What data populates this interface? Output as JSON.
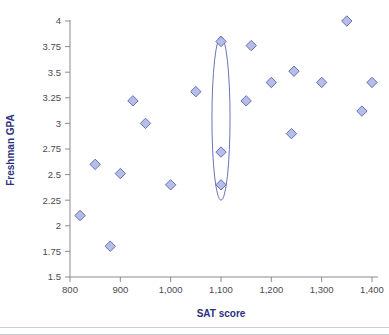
{
  "chart_data": {
    "type": "scatter",
    "title": "",
    "xlabel": "SAT score",
    "ylabel": "Freshman GPA",
    "xlim": [
      800,
      1400
    ],
    "ylim": [
      1.5,
      4
    ],
    "grid": false,
    "legend": "none",
    "x_ticks": [
      800,
      900,
      1000,
      1100,
      1200,
      1300,
      1400
    ],
    "x_tick_labels": [
      "800",
      "900",
      "1,000",
      "1,100",
      "1,200",
      "1,300",
      "1,400"
    ],
    "y_ticks": [
      1.5,
      1.75,
      2,
      2.25,
      2.5,
      2.75,
      3,
      3.25,
      3.5,
      3.75,
      4
    ],
    "y_tick_labels": [
      "1.5",
      "1.75",
      "2",
      "2.25",
      "2.5",
      "2.75",
      "3",
      "3.25",
      "3.5",
      "3.75",
      "4"
    ],
    "marker": "diamond",
    "marker_fill": "#b6bde8",
    "marker_stroke": "#5a63ad",
    "points": [
      {
        "x": 820,
        "y": 2.1
      },
      {
        "x": 850,
        "y": 2.6
      },
      {
        "x": 880,
        "y": 1.8
      },
      {
        "x": 900,
        "y": 2.51
      },
      {
        "x": 925,
        "y": 3.22
      },
      {
        "x": 950,
        "y": 3.0
      },
      {
        "x": 1000,
        "y": 2.4
      },
      {
        "x": 1050,
        "y": 3.31
      },
      {
        "x": 1100,
        "y": 3.8
      },
      {
        "x": 1100,
        "y": 2.72
      },
      {
        "x": 1100,
        "y": 2.4
      },
      {
        "x": 1160,
        "y": 3.76
      },
      {
        "x": 1150,
        "y": 3.22
      },
      {
        "x": 1200,
        "y": 3.4
      },
      {
        "x": 1240,
        "y": 2.9
      },
      {
        "x": 1245,
        "y": 3.51
      },
      {
        "x": 1300,
        "y": 3.4
      },
      {
        "x": 1350,
        "y": 4.0
      },
      {
        "x": 1380,
        "y": 3.12
      },
      {
        "x": 1400,
        "y": 3.4
      }
    ],
    "annotations": [
      {
        "kind": "ellipse",
        "label": "vertical-spread-highlight",
        "center_x": 1100,
        "center_y": 3.05,
        "span_y": [
          2.25,
          3.85
        ],
        "span_x": [
          1082,
          1118
        ]
      }
    ],
    "colors": {
      "axis_title": "#2d3080",
      "tick_label": "#4a4a52",
      "axis_line": "#8a8a93",
      "marker_fill": "#b6bde8",
      "marker_stroke": "#5a63ad",
      "background": "#ffffff"
    }
  }
}
